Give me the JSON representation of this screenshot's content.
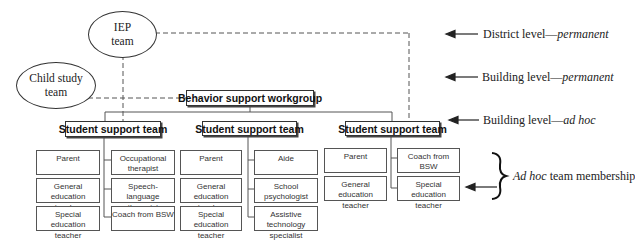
{
  "ellipses": {
    "iep": "IEP\nteam",
    "child_study": "Child study\nteam"
  },
  "workgroup": "Behavior support workgroup",
  "teams": [
    {
      "title": "Student support team",
      "left": [
        "Parent",
        "General education teacher",
        "Special education teacher"
      ],
      "right": [
        "Occupational therapist",
        "Speech-language therapist",
        "Coach from BSW"
      ]
    },
    {
      "title": "Student support team",
      "left": [
        "Parent",
        "General education teacher",
        "Special education teacher"
      ],
      "right": [
        "Aide",
        "School psychologist",
        "Assistive technology specialist"
      ]
    },
    {
      "title": "Student support team",
      "left": [
        "Parent",
        "General education teacher"
      ],
      "right": [
        "Coach from BSW",
        "Special education teacher"
      ]
    }
  ],
  "levels": {
    "district": {
      "main": "District level—",
      "italic": "permanent"
    },
    "building_perm": {
      "main": "Building level—",
      "italic": "permanent"
    },
    "building_adhoc": {
      "main": "Building level—",
      "italic": "ad hoc"
    },
    "membership": {
      "italic": "Ad hoc",
      "main": " team membership"
    }
  }
}
